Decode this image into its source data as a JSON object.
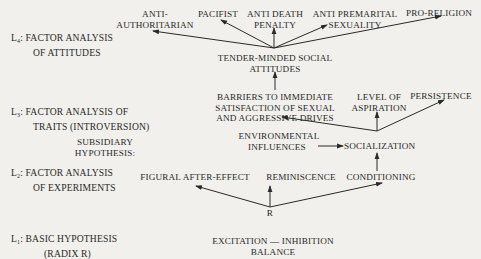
{
  "levels": [
    {
      "id": "L4",
      "prefix": "L",
      "subscript": "4",
      "line1": ": FACTOR ANALYSIS",
      "line2": "OF ATTITUDES"
    },
    {
      "id": "L3",
      "prefix": "L",
      "subscript": "3",
      "line1": ": FACTOR ANALYSIS OF",
      "line2": "TRAITS (INTROVERSION)"
    },
    {
      "id": "L2",
      "prefix": "L",
      "subscript": "2",
      "line1": ": FACTOR ANALYSIS",
      "line2": "OF EXPERIMENTS"
    },
    {
      "id": "L1",
      "prefix": "L",
      "subscript": "1",
      "line1": ": BASIC HYPOTHESIS",
      "line2": "(RADIX R)"
    }
  ],
  "subsidiary": {
    "line1": "SUBSIDIARY",
    "line2": "HYPOTHESIS:"
  },
  "nodes": {
    "anti_authoritarian": {
      "line1": "ANTI-",
      "line2": "AUTHORITARIAN"
    },
    "pacifist": {
      "line1": "PACIFIST"
    },
    "anti_death_penalty": {
      "line1": "ANTI DEATH",
      "line2": "PENALTY"
    },
    "anti_premarital": {
      "line1": "ANTI PREMARITAL",
      "line2": "SEXUALITY"
    },
    "pro_religion": {
      "line1": "PRO-RELIGION"
    },
    "tender_minded": {
      "line1": "TENDER-MINDED SOCIAL",
      "line2": "ATTITUDES"
    },
    "barriers": {
      "line1": "BARRIERS TO IMMEDIATE",
      "line2": "SATISFACTION OF SEXUAL",
      "line3": "AND AGGRESSIVE DRIVES"
    },
    "level_of_aspiration": {
      "line1": "LEVEL OF",
      "line2": "ASPIRATION"
    },
    "persistence": {
      "line1": "PERSISTENCE"
    },
    "environmental": {
      "line1": "ENVIRONMENTAL",
      "line2": "INFLUENCES"
    },
    "socialization": {
      "line1": "SOCIALIZATION"
    },
    "figural": {
      "line1": "FIGURAL AFTER-EFFECT"
    },
    "reminiscence": {
      "line1": "REMINISCENCE"
    },
    "conditioning": {
      "line1": "CONDITIONING"
    },
    "r": {
      "line1": "R"
    },
    "excitation": {
      "line1": "EXCITATION — INHIBITION",
      "line2": "BALANCE"
    }
  },
  "edges": [
    {
      "from": "tender_minded",
      "to": "anti_authoritarian"
    },
    {
      "from": "tender_minded",
      "to": "pacifist"
    },
    {
      "from": "tender_minded",
      "to": "anti_death_penalty"
    },
    {
      "from": "tender_minded",
      "to": "anti_premarital"
    },
    {
      "from": "tender_minded",
      "to": "pro_religion"
    },
    {
      "from": "barriers",
      "to": "tender_minded"
    },
    {
      "from": "socialization",
      "to": "barriers"
    },
    {
      "from": "socialization",
      "to": "level_of_aspiration"
    },
    {
      "from": "socialization",
      "to": "persistence"
    },
    {
      "from": "environmental",
      "to": "socialization"
    },
    {
      "from": "conditioning",
      "to": "socialization"
    },
    {
      "from": "r",
      "to": "figural"
    },
    {
      "from": "r",
      "to": "reminiscence"
    },
    {
      "from": "r",
      "to": "conditioning"
    }
  ],
  "colors": {
    "background": "#f1f0ec",
    "ink": "#2a2a2a"
  }
}
